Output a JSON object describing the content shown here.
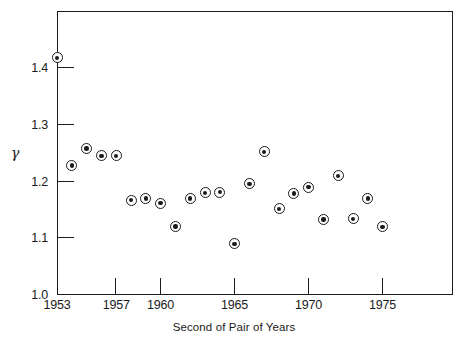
{
  "chart_data": {
    "type": "scatter",
    "title": "",
    "xlabel": "Second of Pair of Years",
    "ylabel": "γ",
    "xlim": [
      1953,
      1977
    ],
    "ylim": [
      1.0,
      1.5
    ],
    "grid": false,
    "legend": "none",
    "xticks": [
      1953,
      1957,
      1960,
      1965,
      1970,
      1975
    ],
    "xtick_labels": [
      "1953",
      "1957",
      "1960",
      "1965",
      "1970",
      "1975"
    ],
    "yticks": [
      1.0,
      1.1,
      1.2,
      1.3,
      1.4
    ],
    "ytick_labels": [
      "1.0",
      "1.1",
      "1.2",
      "1.3",
      "1.4"
    ],
    "marker": "circle-with-center-dot",
    "x": [
      1953,
      1954,
      1955,
      1956,
      1957,
      1958,
      1959,
      1960,
      1961,
      1962,
      1963,
      1964,
      1965,
      1966,
      1967,
      1968,
      1969,
      1970,
      1971,
      1972,
      1973,
      1974,
      1975
    ],
    "y": [
      1.418,
      1.228,
      1.258,
      1.245,
      1.245,
      1.167,
      1.17,
      1.162,
      1.121,
      1.17,
      1.18,
      1.181,
      1.09,
      1.196,
      1.252,
      1.152,
      1.179,
      1.19,
      1.133,
      1.21,
      1.134,
      1.17,
      1.12
    ],
    "points": [
      {
        "x": 1953,
        "y": 1.418
      },
      {
        "x": 1954,
        "y": 1.228
      },
      {
        "x": 1955,
        "y": 1.258
      },
      {
        "x": 1956,
        "y": 1.245
      },
      {
        "x": 1957,
        "y": 1.245
      },
      {
        "x": 1958,
        "y": 1.167
      },
      {
        "x": 1959,
        "y": 1.17
      },
      {
        "x": 1960,
        "y": 1.162
      },
      {
        "x": 1961,
        "y": 1.121
      },
      {
        "x": 1962,
        "y": 1.17
      },
      {
        "x": 1963,
        "y": 1.18
      },
      {
        "x": 1964,
        "y": 1.181
      },
      {
        "x": 1965,
        "y": 1.09
      },
      {
        "x": 1966,
        "y": 1.196
      },
      {
        "x": 1967,
        "y": 1.252
      },
      {
        "x": 1968,
        "y": 1.152
      },
      {
        "x": 1969,
        "y": 1.179
      },
      {
        "x": 1970,
        "y": 1.19
      },
      {
        "x": 1971,
        "y": 1.133
      },
      {
        "x": 1972,
        "y": 1.21
      },
      {
        "x": 1973,
        "y": 1.134
      },
      {
        "x": 1974,
        "y": 1.17
      },
      {
        "x": 1975,
        "y": 1.12
      }
    ]
  }
}
